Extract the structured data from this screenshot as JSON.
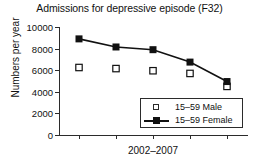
{
  "chart_data": {
    "type": "line",
    "title": "Admissions for depressive episode (F32)",
    "xlabel": "2002–2007",
    "ylabel": "Numbers per year",
    "ylim": [
      0,
      10000
    ],
    "yticks": [
      0,
      2000,
      4000,
      6000,
      8000,
      10000
    ],
    "ytick_labels": [
      "0",
      "2000",
      "4000",
      "6000",
      "8000",
      "10000"
    ],
    "x": [
      2002,
      2003,
      2004,
      2005,
      2006,
      2007
    ],
    "categories": [
      "2002",
      "2003",
      "2004",
      "2005",
      "2006"
    ],
    "grid": false,
    "legend_position": "lower right",
    "series": [
      {
        "name": "15–59 Male",
        "marker": "open-square",
        "line": "none",
        "color": "#111111",
        "values": [
          6250,
          6150,
          5950,
          5700,
          4500
        ]
      },
      {
        "name": "15–59 Female",
        "marker": "filled-square",
        "line": "solid",
        "color": "#111111",
        "values": [
          8900,
          8150,
          7900,
          6750,
          4950
        ]
      }
    ]
  },
  "legend": {
    "items": [
      {
        "label": "15–59 Male"
      },
      {
        "label": "15–59 Female"
      }
    ]
  }
}
